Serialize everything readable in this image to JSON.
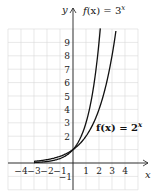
{
  "chart_data": {
    "type": "line",
    "title": "",
    "xlabel": "x",
    "ylabel": "y",
    "xlim": [
      -4,
      4
    ],
    "ylim": [
      -1,
      9
    ],
    "grid": true,
    "legend_position": "inline",
    "x_ticks": [
      "-4",
      "-3",
      "-2",
      "-1",
      "1",
      "2",
      "3",
      "4"
    ],
    "y_ticks": [
      "-1",
      "2",
      "3",
      "4",
      "5",
      "6",
      "7",
      "8",
      "9"
    ],
    "series": [
      {
        "name": "f(x) = 3^x",
        "label_prefix": "f(x) = 3",
        "label_exp": "x",
        "base": 3,
        "x": [
          -3,
          -2,
          -1,
          0,
          1,
          2
        ],
        "values": [
          0.04,
          0.11,
          0.33,
          1,
          3,
          9
        ]
      },
      {
        "name": "f(x) = 2^x",
        "label_prefix": "f(x) = 2",
        "label_exp": "x",
        "base": 2,
        "x": [
          -3,
          -2,
          -1,
          0,
          1,
          2,
          3
        ],
        "values": [
          0.125,
          0.25,
          0.5,
          1,
          2,
          4,
          8
        ]
      }
    ],
    "annotations": [
      "f(x) = 3^x",
      "f(x) = 2^x"
    ]
  },
  "colors": {
    "grid": "#d8d8d8",
    "axis": "#222222",
    "curve": "#111111"
  }
}
